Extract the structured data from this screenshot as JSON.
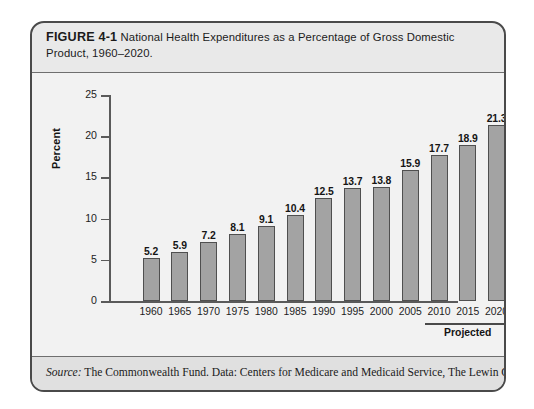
{
  "figure": {
    "number_label": "FIGURE 4-1",
    "caption": "National Health Expenditures as a Percentage of Gross Domestic Product, 1960–2020.",
    "source_label": "Source:",
    "source_text": " The Commonwealth Fund. Data: Centers for Medicare and Medicaid Service, The Lewin Group."
  },
  "annotation": {
    "projected_label": "Projected",
    "projected_start_category": "2010",
    "projected_end_category": "2020"
  },
  "colors": {
    "card_background": "#e9e9e9",
    "card_border": "#4a4a4a",
    "plot_background": "#f2f2f2",
    "bar_fill": "#a3a3a3",
    "bar_stroke": "#4f4f4f",
    "axis": "#5a5a5a",
    "text": "#1b1b1b",
    "source_band": "#e0e0e0"
  },
  "chart_data": {
    "type": "bar",
    "title": "National Health Expenditures as a Percentage of Gross Domestic Product, 1960–2020.",
    "categories": [
      "1960",
      "1965",
      "1970",
      "1975",
      "1980",
      "1985",
      "1990",
      "1995",
      "2000",
      "2005",
      "2010",
      "2015",
      "2020"
    ],
    "values": [
      5.2,
      5.9,
      7.2,
      8.1,
      9.1,
      10.4,
      12.5,
      13.7,
      13.8,
      15.9,
      17.7,
      18.9,
      21.3
    ],
    "value_labels": [
      "5.2",
      "5.9",
      "7.2",
      "8.1",
      "9.1",
      "10.4",
      "12.5",
      "13.7",
      "13.8",
      "15.9",
      "17.7",
      "18.9",
      "21.3"
    ],
    "xlabel": "",
    "ylabel": "Percent",
    "ylim": [
      0,
      25
    ],
    "ytick_values": [
      0,
      5,
      10,
      15,
      20,
      25
    ],
    "ytick_labels": [
      "0",
      "5",
      "10",
      "15",
      "20",
      "25"
    ],
    "grid": false,
    "legend": "none",
    "annotations": [
      {
        "text": "Projected",
        "covers_categories": [
          "2010",
          "2015",
          "2020"
        ]
      }
    ]
  }
}
